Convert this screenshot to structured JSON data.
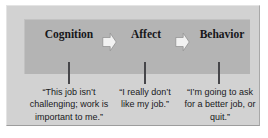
{
  "diagram": {
    "type": "process-flow",
    "title": "",
    "orientation": "horizontal",
    "stages": [
      {
        "id": "cognition",
        "label": "Cognition",
        "caption": "“This job isn’t challenging; work is important to me.”"
      },
      {
        "id": "affect",
        "label": "Affect",
        "caption": "“I really don’t like my job.”"
      },
      {
        "id": "behavior",
        "label": "Behavior",
        "caption": "“I’m going to ask for a better job, or quit.”"
      }
    ],
    "connectors": [
      {
        "id": "arrow-cognition-to-affect",
        "glyph": "right-arrow"
      },
      {
        "id": "arrow-affect-to-behavior",
        "glyph": "right-arrow"
      }
    ],
    "colors": {
      "page_background": "#ffffff",
      "panel_background": "#d2d2d2",
      "band_background": "#b4b4b4",
      "arrow_fill": "#f2f2f2",
      "arrow_stroke": "#8c8c8c",
      "connector_line": "#46464a",
      "heading_text": "#17171a",
      "caption_text": "#19191c"
    }
  }
}
